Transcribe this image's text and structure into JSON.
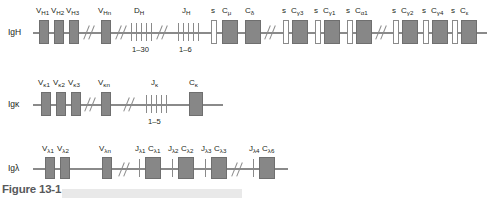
{
  "figure": {
    "caption": "Figure 13-1"
  },
  "colors": {
    "segment_fill": "#878787",
    "switch_fill": "#ffffff",
    "line": "#8a8a8a",
    "text": "#231f20",
    "caption_text": "#58595b",
    "caption_bar": "#e9e9e9"
  },
  "rows": [
    {
      "id": "igh",
      "label": "IgH",
      "label_plain": "IgH",
      "segments": [
        {
          "name": "V-H1",
          "label": "V",
          "sub": "H1",
          "type": "box"
        },
        {
          "name": "V-H2",
          "label": "V",
          "sub": "H2",
          "type": "box"
        },
        {
          "name": "V-H3",
          "label": "V",
          "sub": "H3",
          "type": "box"
        },
        {
          "name": "V-Hn",
          "label": "V",
          "sub": "Hn",
          "type": "box"
        },
        {
          "name": "D-H",
          "label": "D",
          "sub": "H",
          "type": "tick-cluster",
          "range": "1–30"
        },
        {
          "name": "J-H",
          "label": "J",
          "sub": "H",
          "type": "tick-cluster",
          "range": "1–6"
        },
        {
          "name": "switch-mu",
          "label": "s",
          "sub": "",
          "type": "switch"
        },
        {
          "name": "C-mu",
          "label": "C",
          "sub": "μ",
          "type": "box"
        },
        {
          "name": "C-delta",
          "label": "C",
          "sub": "δ",
          "type": "box"
        },
        {
          "name": "switch-gamma3",
          "label": "s",
          "sub": "",
          "type": "switch"
        },
        {
          "name": "C-gamma3",
          "label": "C",
          "sub": "γ3",
          "type": "box"
        },
        {
          "name": "switch-gamma1",
          "label": "s",
          "sub": "",
          "type": "switch"
        },
        {
          "name": "C-gamma1",
          "label": "C",
          "sub": "γ1",
          "type": "box"
        },
        {
          "name": "switch-alpha1",
          "label": "s",
          "sub": "",
          "type": "switch"
        },
        {
          "name": "C-alpha1",
          "label": "C",
          "sub": "α1",
          "type": "box"
        },
        {
          "name": "switch-gamma2",
          "label": "s",
          "sub": "",
          "type": "switch"
        },
        {
          "name": "C-gamma2",
          "label": "C",
          "sub": "γ2",
          "type": "box"
        },
        {
          "name": "switch-gamma4",
          "label": "s",
          "sub": "",
          "type": "switch"
        },
        {
          "name": "C-gamma4",
          "label": "C",
          "sub": "γ4",
          "type": "box"
        },
        {
          "name": "switch-epsilon",
          "label": "s",
          "sub": "",
          "type": "switch"
        },
        {
          "name": "C-epsilon",
          "label": "C",
          "sub": "ε",
          "type": "box"
        },
        {
          "name": "switch-alpha2",
          "label": "s",
          "sub": "",
          "type": "switch"
        },
        {
          "name": "C-alpha2",
          "label": "C",
          "sub": "α2",
          "type": "box"
        }
      ]
    },
    {
      "id": "igk",
      "label": "Igκ",
      "label_plain": "Igk",
      "segments": [
        {
          "name": "V-k1",
          "label": "V",
          "sub": "κ1",
          "type": "box"
        },
        {
          "name": "V-k2",
          "label": "V",
          "sub": "κ2",
          "type": "box"
        },
        {
          "name": "V-k3",
          "label": "V",
          "sub": "κ3",
          "type": "box"
        },
        {
          "name": "V-kn",
          "label": "V",
          "sub": "κn",
          "type": "box"
        },
        {
          "name": "J-k",
          "label": "J",
          "sub": "κ",
          "type": "tick-cluster",
          "range": "1–5"
        },
        {
          "name": "C-k",
          "label": "C",
          "sub": "κ",
          "type": "box"
        }
      ]
    },
    {
      "id": "iglambda",
      "label": "Igλ",
      "label_plain": "Iglambda",
      "segments": [
        {
          "name": "V-l1",
          "label": "V",
          "sub": "λ1",
          "type": "box"
        },
        {
          "name": "V-l2",
          "label": "V",
          "sub": "λ2",
          "type": "box"
        },
        {
          "name": "V-ln",
          "label": "V",
          "sub": "λn",
          "type": "box"
        },
        {
          "name": "J-l1",
          "label": "J",
          "sub": "λ1",
          "type": "tick"
        },
        {
          "name": "C-l1",
          "label": "C",
          "sub": "λ1",
          "type": "box"
        },
        {
          "name": "J-l2",
          "label": "J",
          "sub": "λ2",
          "type": "tick"
        },
        {
          "name": "C-l2",
          "label": "C",
          "sub": "λ2",
          "type": "box"
        },
        {
          "name": "J-l3",
          "label": "J",
          "sub": "λ3",
          "type": "tick"
        },
        {
          "name": "C-l3",
          "label": "C",
          "sub": "λ3",
          "type": "box"
        },
        {
          "name": "J-l4",
          "label": "J",
          "sub": "λ4",
          "type": "tick"
        },
        {
          "name": "C-l6",
          "label": "C",
          "sub": "λ6",
          "type": "box"
        }
      ]
    }
  ],
  "labels": {
    "igh_vh1": "V",
    "igh_vh1_sub": "H1",
    "igh_vh2": "V",
    "igh_vh2_sub": "H2",
    "igh_vh3": "V",
    "igh_vh3_sub": "H3",
    "igh_vhn": "V",
    "igh_vhn_sub": "Hn",
    "igh_dh": "D",
    "igh_dh_sub": "H",
    "igh_dh_range": "1–30",
    "igh_jh": "J",
    "igh_jh_sub": "H",
    "igh_jh_range": "1–6",
    "s": "s",
    "c_mu": "C",
    "c_mu_sub": "μ",
    "c_delta": "C",
    "c_delta_sub": "δ",
    "c_g3": "C",
    "c_g3_sub": "γ3",
    "c_g1": "C",
    "c_g1_sub": "γ1",
    "c_a1": "C",
    "c_a1_sub": "α1",
    "c_g2": "C",
    "c_g2_sub": "γ2",
    "c_g4": "C",
    "c_g4_sub": "γ4",
    "c_e": "C",
    "c_e_sub": "ε",
    "c_a2": "C",
    "c_a2_sub": "α2",
    "igk_v1": "V",
    "igk_v1_sub": "κ1",
    "igk_v2": "V",
    "igk_v2_sub": "κ2",
    "igk_v3": "V",
    "igk_v3_sub": "κ3",
    "igk_vn": "V",
    "igk_vn_sub": "κn",
    "igk_j": "J",
    "igk_j_sub": "κ",
    "igk_j_range": "1–5",
    "igk_c": "C",
    "igk_c_sub": "κ",
    "igl_v1": "V",
    "igl_v1_sub": "λ1",
    "igl_v2": "V",
    "igl_v2_sub": "λ2",
    "igl_vn": "V",
    "igl_vn_sub": "λn",
    "igl_j1": "J",
    "igl_j1_sub": "λ1",
    "igl_c1": "C",
    "igl_c1_sub": "λ1",
    "igl_j2": "J",
    "igl_j2_sub": "λ2",
    "igl_c2": "C",
    "igl_c2_sub": "λ2",
    "igl_j3": "J",
    "igl_j3_sub": "λ3",
    "igl_c3": "C",
    "igl_c3_sub": "λ3",
    "igl_j4": "J",
    "igl_j4_sub": "λ4",
    "igl_c6": "C",
    "igl_c6_sub": "λ6"
  }
}
